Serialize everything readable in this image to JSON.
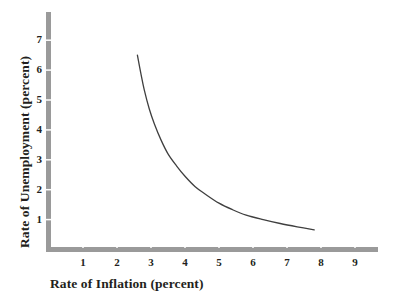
{
  "chart_data": {
    "type": "line",
    "title": "",
    "xlabel": "Rate of Inflation (percent)",
    "ylabel": "Rate of Unemployment (percent)",
    "xlim": [
      0,
      9.7
    ],
    "ylim": [
      0,
      7.7
    ],
    "xticks": [
      "1",
      "2",
      "3",
      "4",
      "5",
      "6",
      "7",
      "8",
      "9"
    ],
    "xtick_values": [
      1,
      2,
      3,
      4,
      5,
      6,
      7,
      8,
      9
    ],
    "yticks": [
      "1",
      "2",
      "3",
      "4",
      "5",
      "6",
      "7"
    ],
    "ytick_values": [
      1,
      2,
      3,
      4,
      5,
      6,
      7
    ],
    "grid": false,
    "legend": false,
    "legend_position": "none",
    "series": [
      {
        "name": "Phillips curve",
        "color": "#3f3f3f",
        "x": [
          2.6,
          2.7,
          2.8,
          2.95,
          3.1,
          3.3,
          3.5,
          3.75,
          4.0,
          4.3,
          4.6,
          5.0,
          5.4,
          5.8,
          6.3,
          6.8,
          7.3,
          7.8
        ],
        "y": [
          6.5,
          5.9,
          5.35,
          4.7,
          4.2,
          3.65,
          3.2,
          2.8,
          2.45,
          2.1,
          1.85,
          1.55,
          1.33,
          1.15,
          1.0,
          0.87,
          0.76,
          0.66
        ]
      }
    ],
    "colors": {
      "axis": "#9a9a9a",
      "curve": "#3f3f3f",
      "text": "#231f20",
      "background": "#ffffff"
    }
  }
}
